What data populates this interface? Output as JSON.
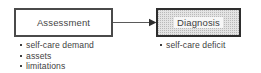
{
  "diagram": {
    "type": "flow-diagram",
    "title": "",
    "nodes": [
      {
        "id": "assessment",
        "label": "Assessment",
        "fill": "#ffffff",
        "border": "#4a4a4a",
        "bullets": [
          "self-care demand",
          "assets",
          "limitations"
        ]
      },
      {
        "id": "diagnosis",
        "label": "Diagnosis",
        "fill": "#e4e4e4",
        "border": "#2e2e2e",
        "bullets": [
          "self-care deficit"
        ]
      }
    ],
    "edges": [
      {
        "id": "assessment-to-diagnosis",
        "from": "Assessment",
        "to": "Diagnosis",
        "style": "solid-arrow",
        "color": "#5a5a5a"
      }
    ]
  }
}
